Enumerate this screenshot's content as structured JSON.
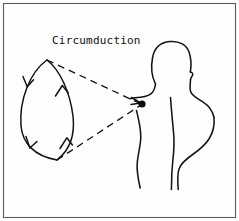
{
  "figure": {
    "title": "Circumduction",
    "background_color": "#fefefe",
    "ink_color": "#141414",
    "frame_color": "#5b5b5b",
    "label": {
      "text": "Circumduction",
      "x": 52,
      "y": 44
    },
    "pivot": {
      "name": "shoulder-joint",
      "x": 142,
      "y": 104,
      "radius": 3.6,
      "color": "#0a0a0a"
    },
    "cone_lines": [
      {
        "name": "upper-cone-line",
        "from_x": 47,
        "from_y": 60,
        "to_x": 142,
        "to_y": 104,
        "dash": "7 5"
      },
      {
        "name": "lower-cone-line",
        "from_x": 57,
        "from_y": 160,
        "to_x": 142,
        "to_y": 104,
        "dash": "7 5"
      }
    ],
    "motion_path": {
      "name": "circumduction-ellipse",
      "shape": "lens",
      "top_x": 47,
      "top_y": 60,
      "bottom_x": 57,
      "bottom_y": 160,
      "left_bulge_x": 18,
      "right_bulge_x": 74,
      "arrow_count": 4,
      "direction": "clockwise"
    },
    "arrows": [
      {
        "name": "arrow-left-upper",
        "direction": "down",
        "x": 27,
        "y": 84
      },
      {
        "name": "arrow-left-lower",
        "direction": "down",
        "x": 36,
        "y": 146
      },
      {
        "name": "arrow-right-lower",
        "direction": "up",
        "x": 66,
        "y": 139
      },
      {
        "name": "arrow-right-upper",
        "direction": "up",
        "x": 62,
        "y": 88
      }
    ],
    "body_parts": [
      {
        "name": "head-outline"
      },
      {
        "name": "ear-notch"
      },
      {
        "name": "neck-and-shoulder-left"
      },
      {
        "name": "torso-left-contour"
      },
      {
        "name": "arm-inner-line"
      },
      {
        "name": "torso-right-contour"
      },
      {
        "name": "shoulder-right-slope"
      }
    ]
  }
}
